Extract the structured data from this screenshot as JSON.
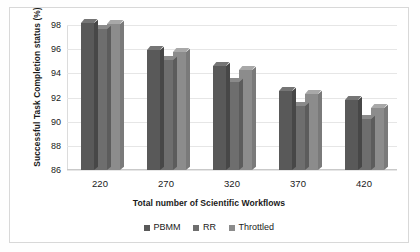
{
  "chart_data": {
    "type": "bar",
    "title": "",
    "xlabel": "Total number of Scientific Workflows",
    "ylabel": "Successful Task Completion status (%)",
    "categories": [
      "220",
      "270",
      "320",
      "370",
      "420"
    ],
    "ylim": [
      86,
      98
    ],
    "yticks": [
      "86",
      "88",
      "90",
      "92",
      "94",
      "96",
      "98"
    ],
    "grid": true,
    "legend_position": "bottom",
    "series": [
      {
        "name": "PBMM",
        "color": "#595959",
        "values": [
          98.2,
          95.9,
          94.6,
          92.5,
          91.8
        ]
      },
      {
        "name": "RR",
        "color": "#6e6e6e",
        "values": [
          97.7,
          95.1,
          93.3,
          91.3,
          90.2
        ]
      },
      {
        "name": "Throttled",
        "color": "#8c8c8c",
        "values": [
          98.1,
          95.8,
          94.3,
          92.3,
          91.1
        ]
      }
    ]
  },
  "legend": {
    "items": [
      {
        "label": "PBMM"
      },
      {
        "label": "RR"
      },
      {
        "label": "Throttled"
      }
    ]
  }
}
